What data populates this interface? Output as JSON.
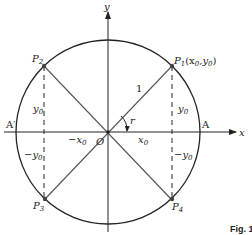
{
  "diagram": {
    "axes": {
      "x_label": "x",
      "y_label": "y"
    },
    "circle": {
      "radius_label": "1"
    },
    "points": {
      "origin": "O",
      "A": "A",
      "A_prime": "A′",
      "P1": {
        "name": "P",
        "sub": "1",
        "coords": "(x",
        "coord_x_sub": "0",
        "coord_sep": ",y",
        "coord_y_sub": "0",
        "close": ")"
      },
      "P2": {
        "name": "P",
        "sub": "2"
      },
      "P3": {
        "name": "P",
        "sub": "3"
      },
      "P4": {
        "name": "P",
        "sub": "4"
      }
    },
    "segment_labels": {
      "y0_left": {
        "base": "y",
        "sub": "0"
      },
      "y0_right": {
        "base": "y",
        "sub": "0"
      },
      "neg_y0_left": {
        "base": "−y",
        "sub": "0"
      },
      "neg_y0_right": {
        "base": "−y",
        "sub": "0"
      },
      "neg_x0": {
        "base": "−x",
        "sub": "0"
      },
      "x0": {
        "base": "x",
        "sub": "0"
      }
    },
    "angle_label": "r",
    "caption": "Fig. 1"
  },
  "colors": {
    "line": "#222222",
    "diag": "#555555"
  }
}
